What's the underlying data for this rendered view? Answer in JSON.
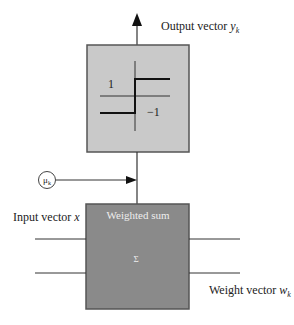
{
  "diagram": {
    "output_label": {
      "text": "Output vector ",
      "var": "y",
      "sub": "k"
    },
    "activation_block": {
      "type": "signum step function",
      "label_high": "1",
      "label_low": "−1",
      "fill": "#c9c9c9"
    },
    "learning_rate": {
      "symbol": "μ",
      "sub": "k"
    },
    "sum_block": {
      "title": "Weighted sum",
      "symbol": "Σ",
      "fill": "#8a8a8a",
      "text_color": "#eeeeee"
    },
    "input_label": {
      "text": "Input vector ",
      "var": "x"
    },
    "weight_label": {
      "text": "Weight vector ",
      "var": "w",
      "sub": "k"
    },
    "colors": {
      "line": "#333333",
      "border": "#555555",
      "text": "#222222"
    }
  }
}
